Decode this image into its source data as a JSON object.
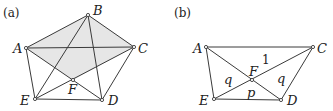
{
  "panels": [
    {
      "id": "a",
      "label": "(a)",
      "points": [
        {
          "name": "A",
          "label": "A"
        },
        {
          "name": "B",
          "label": "B"
        },
        {
          "name": "C",
          "label": "C"
        },
        {
          "name": "D",
          "label": "D"
        },
        {
          "name": "E",
          "label": "E"
        },
        {
          "name": "F",
          "label": "F"
        }
      ],
      "edges": [
        [
          "A",
          "B"
        ],
        [
          "B",
          "C"
        ],
        [
          "A",
          "C"
        ],
        [
          "A",
          "E"
        ],
        [
          "E",
          "D"
        ],
        [
          "D",
          "C"
        ],
        [
          "B",
          "E"
        ],
        [
          "B",
          "D"
        ],
        [
          "A",
          "D"
        ],
        [
          "E",
          "C"
        ]
      ],
      "shaded_region": [
        "A",
        "B",
        "C",
        "F"
      ],
      "shade_color": "#e6e6e6"
    },
    {
      "id": "b",
      "label": "(b)",
      "points": [
        {
          "name": "A",
          "label": "A"
        },
        {
          "name": "C",
          "label": "C"
        },
        {
          "name": "D",
          "label": "D"
        },
        {
          "name": "E",
          "label": "E"
        },
        {
          "name": "F",
          "label": "F"
        }
      ],
      "edges": [
        [
          "A",
          "C"
        ],
        [
          "A",
          "E"
        ],
        [
          "E",
          "D"
        ],
        [
          "D",
          "C"
        ],
        [
          "A",
          "D"
        ],
        [
          "E",
          "C"
        ]
      ],
      "region_labels": [
        {
          "region": "AFC",
          "text": "1"
        },
        {
          "region": "AFE",
          "text": "q"
        },
        {
          "region": "CFD",
          "text": "q"
        },
        {
          "region": "EFD",
          "text": "p"
        }
      ]
    }
  ],
  "colors": {
    "line": "#3a3a3a",
    "text": "#222222",
    "shade": "#e6e6e6",
    "background": "#ffffff"
  }
}
